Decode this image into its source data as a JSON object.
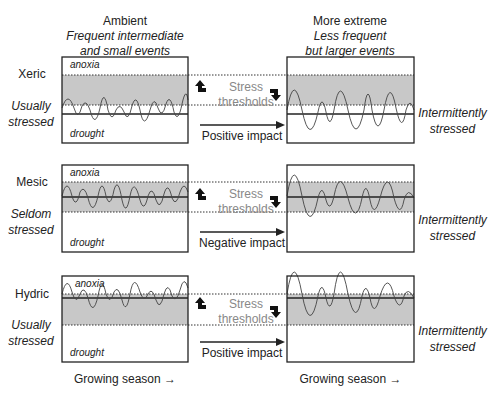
{
  "columns": {
    "left": {
      "title": "Ambient",
      "subtitle_line1": "Frequent intermediate",
      "subtitle_line2": "and small events"
    },
    "right": {
      "title": "More extreme",
      "subtitle_line1": "Less frequent",
      "subtitle_line2": "but larger events"
    }
  },
  "rows": [
    {
      "site": "Xeric",
      "left_status_line1": "Usually",
      "left_status_line2": "stressed",
      "right_status_line1": "Intermittently",
      "right_status_line2": "stressed",
      "box_label_top": "anoxia",
      "box_label_bottom": "drought",
      "threshold_label_line1": "Stress",
      "threshold_label_line2": "thresholds",
      "impact": "Positive impact"
    },
    {
      "site": "Mesic",
      "left_status_line1": "Seldom",
      "left_status_line2": "stressed",
      "right_status_line1": "Intermittently",
      "right_status_line2": "stressed",
      "box_label_top": "anoxia",
      "box_label_bottom": "drought",
      "threshold_label_line1": "Stress",
      "threshold_label_line2": "thresholds",
      "impact": "Negative impact"
    },
    {
      "site": "Hydric",
      "left_status_line1": "Usually",
      "left_status_line2": "stressed",
      "right_status_line1": "Intermittently",
      "right_status_line2": "stressed",
      "box_label_top": "anoxia",
      "box_label_bottom": "drought",
      "threshold_label_line1": "Stress",
      "threshold_label_line2": "thresholds",
      "impact": "Positive impact"
    }
  ],
  "footer": {
    "left": "Growing season →",
    "right": "Growing season →"
  },
  "colors": {
    "shade": "#c8c8c8",
    "line": "#222222",
    "threshold_text": "#888888"
  }
}
